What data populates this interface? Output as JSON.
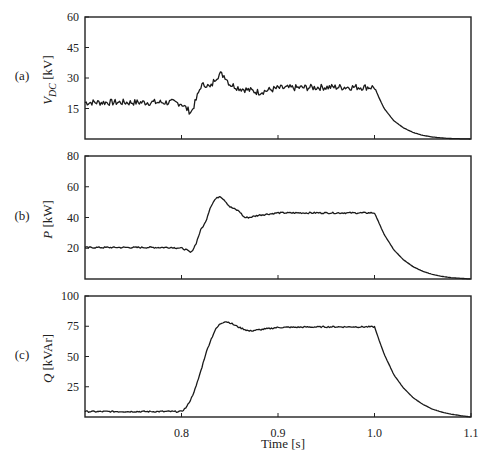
{
  "chart_data": [
    {
      "id": "a",
      "type": "line",
      "panel_label": "(a)",
      "ylabel": "V_DC [kV]",
      "ylabel_main": "V",
      "ylabel_sub": "DC",
      "ylabel_unit": " [kV]",
      "xlabel": "",
      "xlim": [
        0.7,
        1.1
      ],
      "ylim": [
        0,
        60
      ],
      "yticks": [
        15,
        30,
        45,
        60
      ],
      "xticks": [
        0.8,
        0.9,
        1.0
      ],
      "show_xtick_labels": false,
      "noise_amplitude": 1.6,
      "series": [
        {
          "name": "V_DC",
          "x": [
            0.7,
            0.79,
            0.8,
            0.805,
            0.81,
            0.815,
            0.82,
            0.825,
            0.83,
            0.835,
            0.84,
            0.845,
            0.85,
            0.86,
            0.87,
            0.88,
            0.9,
            0.95,
            1.0,
            1.005,
            1.01,
            1.02,
            1.03,
            1.04,
            1.05,
            1.06,
            1.07,
            1.08,
            1.1
          ],
          "y": [
            18,
            18,
            17.5,
            15,
            13,
            19,
            26,
            27,
            25,
            30,
            32,
            31,
            27,
            25,
            24,
            23,
            25,
            25.5,
            25.5,
            20,
            15,
            9,
            5.5,
            3.2,
            1.8,
            1,
            0.5,
            0.2,
            0
          ]
        }
      ]
    },
    {
      "id": "b",
      "type": "line",
      "panel_label": "(b)",
      "ylabel": "P [kW]",
      "ylabel_main": "P",
      "ylabel_sub": "",
      "ylabel_unit": " [kW]",
      "xlabel": "",
      "xlim": [
        0.7,
        1.1
      ],
      "ylim": [
        0,
        80
      ],
      "yticks": [
        20,
        40,
        60,
        80
      ],
      "xticks": [
        0.8,
        0.9,
        1.0
      ],
      "show_xtick_labels": false,
      "noise_amplitude": 0.5,
      "series": [
        {
          "name": "P",
          "x": [
            0.7,
            0.79,
            0.8,
            0.805,
            0.81,
            0.815,
            0.82,
            0.825,
            0.83,
            0.835,
            0.84,
            0.845,
            0.85,
            0.86,
            0.865,
            0.87,
            0.88,
            0.9,
            0.95,
            1.0,
            1.005,
            1.01,
            1.02,
            1.03,
            1.04,
            1.05,
            1.06,
            1.07,
            1.08,
            1.1
          ],
          "y": [
            20.5,
            20.5,
            20,
            19,
            17,
            23,
            32,
            37,
            47,
            52,
            54,
            51,
            47,
            44,
            40,
            40,
            41.5,
            43,
            43,
            43,
            36,
            29,
            19,
            12.5,
            8,
            5,
            3,
            1.7,
            0.8,
            0
          ]
        }
      ]
    },
    {
      "id": "c",
      "type": "line",
      "panel_label": "(c)",
      "ylabel": "Q [kVAr]",
      "ylabel_main": "Q",
      "ylabel_sub": "",
      "ylabel_unit": " [kVAr]",
      "xlabel": "Time [s]",
      "xlim": [
        0.7,
        1.1
      ],
      "ylim": [
        0,
        100
      ],
      "yticks": [
        25,
        50,
        75,
        100
      ],
      "xticks": [
        0.8,
        0.9,
        1.0,
        1.1
      ],
      "xtick_labels": [
        "0.8",
        "0.9",
        "1.0",
        "1.1"
      ],
      "show_xtick_labels": true,
      "noise_amplitude": 0.6,
      "series": [
        {
          "name": "Q",
          "x": [
            0.7,
            0.79,
            0.8,
            0.805,
            0.81,
            0.815,
            0.82,
            0.825,
            0.83,
            0.835,
            0.84,
            0.845,
            0.85,
            0.86,
            0.87,
            0.88,
            0.9,
            0.95,
            1.0,
            1.005,
            1.01,
            1.02,
            1.03,
            1.04,
            1.05,
            1.06,
            1.07,
            1.08,
            1.09,
            1.1
          ],
          "y": [
            4.5,
            4.5,
            4.5,
            8,
            15,
            25,
            38,
            52,
            63,
            72,
            77,
            79,
            78,
            74,
            71,
            72,
            74,
            74.5,
            74.5,
            63,
            52,
            35,
            24,
            16,
            10.5,
            6.5,
            4,
            2.3,
            1,
            0
          ]
        }
      ]
    }
  ],
  "layout": {
    "plot_left": 85,
    "plot_right": 471,
    "panels": [
      {
        "top": 17,
        "bottom": 139
      },
      {
        "top": 156,
        "bottom": 279
      },
      {
        "top": 296,
        "bottom": 417
      }
    ],
    "xlabel_y": 448
  }
}
